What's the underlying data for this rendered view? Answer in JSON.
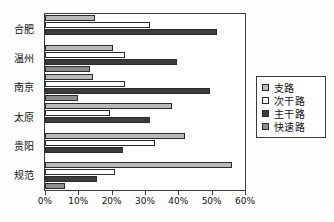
{
  "chart_data": {
    "type": "bar",
    "orientation": "horizontal",
    "title": "",
    "xlabel": "",
    "ylabel": "",
    "xlim": [
      0,
      60
    ],
    "xunit": "%",
    "grid": false,
    "legend_position": "right",
    "categories": [
      "合肥",
      "温州",
      "南京",
      "太原",
      "贵阳",
      "规范"
    ],
    "tick_labels": [
      "0%",
      "10%",
      "20%",
      "30%",
      "40%",
      "50%",
      "60%"
    ],
    "tick_values": [
      0,
      10,
      20,
      30,
      40,
      50,
      60
    ],
    "series": [
      {
        "name": "支路",
        "color": "#b9b9b9",
        "values": [
          15.0,
          20.5,
          14.5,
          38.0,
          42.0,
          56.0
        ]
      },
      {
        "name": "次干路",
        "color": "#ffffff",
        "values": [
          31.5,
          24.0,
          24.0,
          19.5,
          33.0,
          21.0
        ]
      },
      {
        "name": "主干路",
        "color": "#3b3b3b",
        "values": [
          51.5,
          39.5,
          49.5,
          31.5,
          23.5,
          15.5
        ]
      },
      {
        "name": "快速路",
        "color": "#8e8e8e",
        "values": [
          0,
          13.5,
          10.0,
          0,
          0,
          6.0
        ]
      }
    ]
  },
  "legend": {
    "items": [
      {
        "label": "支路"
      },
      {
        "label": "次干路"
      },
      {
        "label": "主干路"
      },
      {
        "label": "快速路"
      }
    ]
  }
}
